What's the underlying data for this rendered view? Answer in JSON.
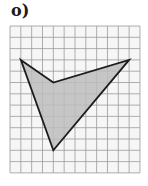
{
  "label": "o)",
  "grid": {
    "x0": 10,
    "y0": 26,
    "cols": 12,
    "rows": 13,
    "cell_w": 10.83,
    "cell_h": 11.3,
    "line_color": "#9a9a9a",
    "background": "#f6f6f6"
  },
  "shape": {
    "type": "concave quadrilateral (arrowhead)",
    "vertices_grid": [
      [
        1,
        3
      ],
      [
        4,
        5
      ],
      [
        11,
        3
      ],
      [
        4,
        11
      ]
    ],
    "fill": "#bdbdbd",
    "stroke": "#1c1c1c"
  }
}
